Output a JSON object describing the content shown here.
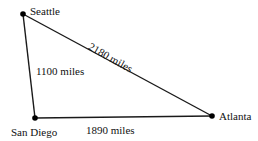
{
  "diagram": {
    "type": "triangle-distance-diagram",
    "stroke_color": "#1a1a1a",
    "vertex_color": "#000000",
    "background": "#ffffff",
    "vertices": [
      {
        "id": "seattle",
        "label": "Seattle",
        "x": 23,
        "y": 14,
        "label_x": 30,
        "label_y": 6
      },
      {
        "id": "sandiego",
        "label": "San Diego",
        "x": 35,
        "y": 118,
        "label_x": 11,
        "label_y": 127
      },
      {
        "id": "atlanta",
        "label": "Atlanta",
        "x": 212,
        "y": 116,
        "label_x": 219,
        "label_y": 111
      }
    ],
    "edges": [
      {
        "id": "seattle-sandiego",
        "from": "seattle",
        "to": "sandiego",
        "label": "1100 miles",
        "rotation": 0,
        "label_x": 36,
        "label_y": 66
      },
      {
        "id": "seattle-atlanta",
        "from": "seattle",
        "to": "atlanta",
        "label": "2180 miles",
        "rotation": 29.5,
        "label_x": 92,
        "label_y": 41
      },
      {
        "id": "sandiego-atlanta",
        "from": "sandiego",
        "to": "atlanta",
        "label": "1890 miles",
        "rotation": 0,
        "label_x": 86,
        "label_y": 125
      }
    ]
  }
}
